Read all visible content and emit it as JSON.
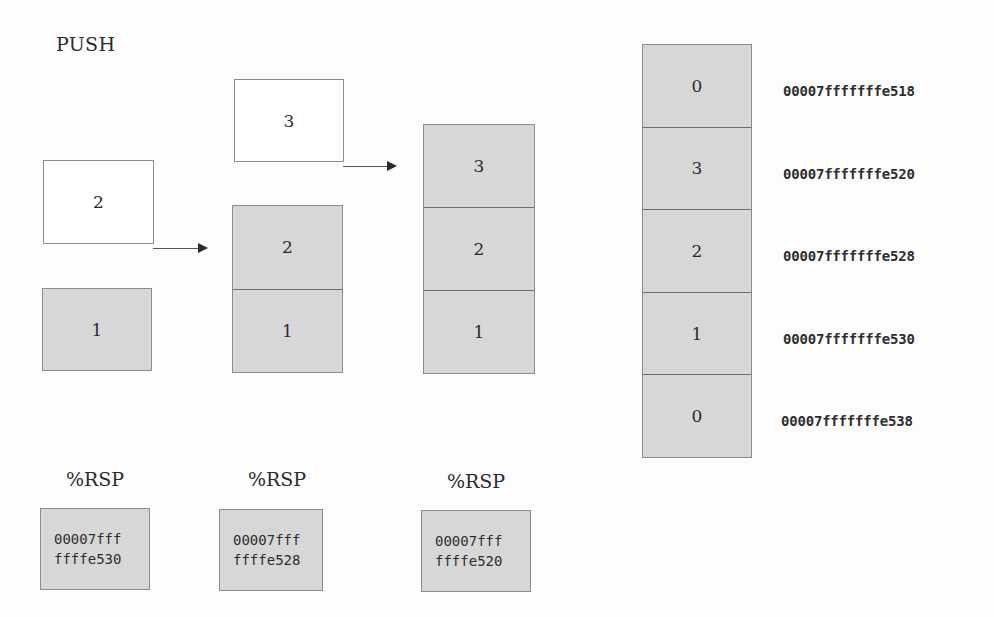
{
  "title": "PUSH",
  "steps": [
    {
      "incoming": "2",
      "stack": [
        "1"
      ]
    },
    {
      "incoming": "3",
      "stack": [
        "2",
        "1"
      ]
    },
    {
      "incoming": null,
      "stack": [
        "3",
        "2",
        "1"
      ]
    }
  ],
  "rsp": {
    "label": "%RSP",
    "values": [
      {
        "line1": "00007fff",
        "line2": "ffffe530"
      },
      {
        "line1": "00007fff",
        "line2": "ffffe528"
      },
      {
        "line1": "00007fff",
        "line2": "ffffe520"
      }
    ]
  },
  "memory": {
    "cells": [
      {
        "value": "0",
        "address": "00007fffffffe518"
      },
      {
        "value": "3",
        "address": "00007fffffffe520"
      },
      {
        "value": "2",
        "address": "00007fffffffe528"
      },
      {
        "value": "1",
        "address": "00007fffffffe530"
      },
      {
        "value": "0",
        "address": "00007fffffffe538"
      }
    ]
  },
  "colors": {
    "cell_fill": "#d7d7d7",
    "cell_border": "#8c8c8c",
    "text": "#2b2b2b",
    "background": "#fdfdfd"
  }
}
